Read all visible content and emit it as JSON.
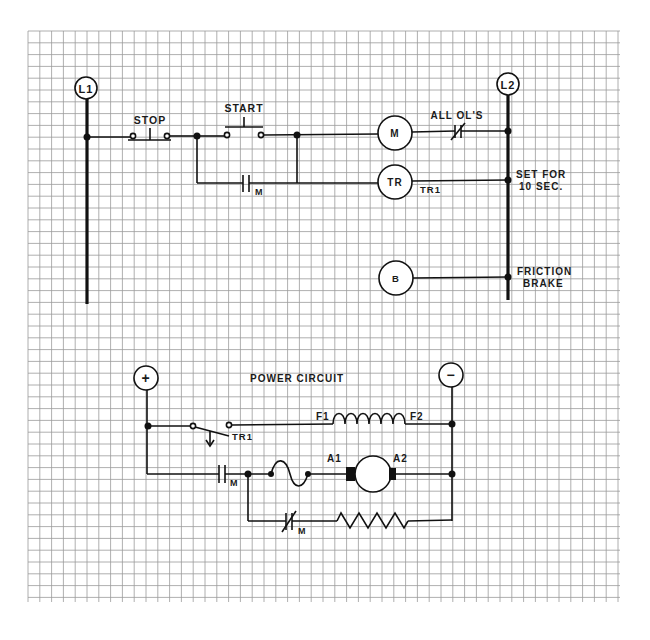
{
  "diagram": {
    "grid": {
      "x0": 28,
      "y0": 31,
      "x1": 620,
      "y1": 602,
      "spacing": 11.8,
      "color": "#9a9a9a"
    },
    "control_circuit": {
      "line1_label": "L1",
      "line2_label": "L2",
      "stop_label": "STOP",
      "start_label": "START",
      "holding_contact_label": "M",
      "motor_coil_label": "M",
      "overload_label": "ALL OL'S",
      "timer_coil_label": "TR",
      "timer_contact_label": "TR1",
      "timer_note_line1": "SET FOR",
      "timer_note_line2": "10 SEC.",
      "brake_coil_label": "B",
      "brake_note_line1": "FRICTION",
      "brake_note_line2": "BRAKE"
    },
    "power_circuit": {
      "title": "POWER CIRCUIT",
      "positive_label": "+",
      "negative_label": "−",
      "timer_contact_label": "TR1",
      "field_start_label": "F1",
      "field_end_label": "F2",
      "main_contact_label": "M",
      "armature_a1_label": "A1",
      "armature_a2_label": "A2",
      "nc_contact_label": "M"
    }
  }
}
